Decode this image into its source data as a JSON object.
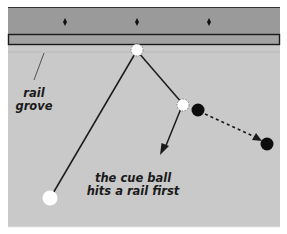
{
  "diagram": {
    "title": "Cue ball hits a rail first",
    "colors": {
      "rail": "#9a9a9a",
      "table": "#c9c9c9",
      "outline": "#222222",
      "ball_black": "#0d0d0d",
      "cue_ball": "#ffffff"
    },
    "labels": {
      "rail_groove_line1": "rail",
      "rail_groove_line2": "grove",
      "caption_line1": "the cue ball",
      "caption_line2": "hits a rail first"
    },
    "diamonds": [
      65,
      137,
      209
    ],
    "balls": {
      "cue_ball": {
        "x": 50,
        "y": 198
      },
      "ghost_ball_rail": {
        "x": 137,
        "y": 50
      },
      "ghost_ball_contact": {
        "x": 183,
        "y": 105
      },
      "object_ball": {
        "x": 198,
        "y": 110
      },
      "object_ball_target": {
        "x": 267,
        "y": 144
      }
    }
  }
}
